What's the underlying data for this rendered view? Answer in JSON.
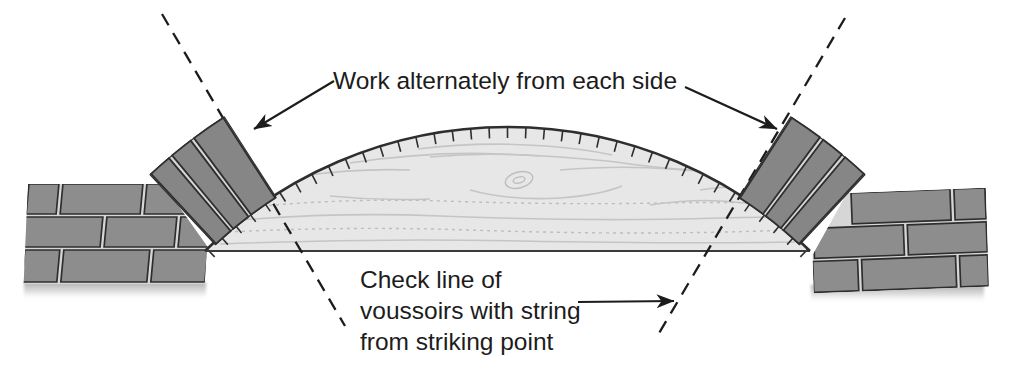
{
  "labels": {
    "work_alternately": "Work alternately from each side",
    "check_line_1": "Check line of",
    "check_line_2": "voussoirs with string",
    "check_line_3": "from striking point"
  },
  "colors": {
    "background": "#ffffff",
    "line": "#1c1c1c",
    "brick": "#8d8d8d",
    "voussoir_brick": "#868686",
    "mortar": "#d6d6d6",
    "outline": "#2e2e2e",
    "form_fill": "#e7e7e7",
    "grain": "#c5c5c5"
  }
}
